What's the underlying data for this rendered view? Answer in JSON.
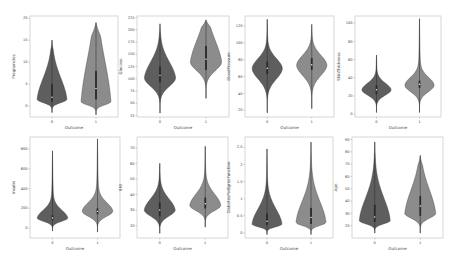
{
  "figure": {
    "colors": {
      "outcome_0": "#5e5e5e",
      "outcome_1": "#8c8c8c",
      "stroke": "#3a3a3a",
      "box": "#2b2b2b",
      "frame": "#bdbdbd"
    }
  },
  "chart_data": [
    {
      "type": "violin",
      "ylabel": "Pregnancies",
      "xlabel": "Outcome",
      "categories": [
        "0",
        "1"
      ],
      "yticks": [
        0,
        5,
        10,
        15,
        20
      ],
      "ylim": [
        -2.5,
        20.5
      ],
      "series": [
        {
          "name": "0",
          "min": -1.5,
          "q1": 1,
          "median": 2,
          "q3": 5,
          "max": 15,
          "peak": 1.5
        },
        {
          "name": "1",
          "min": -2,
          "q1": 1.5,
          "median": 4,
          "q3": 8,
          "max": 19,
          "peak": 1
        }
      ]
    },
    {
      "type": "violin",
      "ylabel": "Glucose",
      "xlabel": "Outcome",
      "categories": [
        "0",
        "1"
      ],
      "yticks": [
        25,
        50,
        75,
        100,
        125,
        150,
        175,
        200,
        225
      ],
      "ylim": [
        22,
        228
      ],
      "series": [
        {
          "name": "0",
          "min": 30,
          "q1": 93,
          "median": 107,
          "q3": 125,
          "max": 212,
          "peak": 102
        },
        {
          "name": "1",
          "min": 60,
          "q1": 118,
          "median": 140,
          "q3": 167,
          "max": 220,
          "peak": 135
        }
      ]
    },
    {
      "type": "violin",
      "ylabel": "BloodPressure",
      "xlabel": "Outcome",
      "categories": [
        "0",
        "1"
      ],
      "yticks": [
        20,
        40,
        60,
        80,
        100,
        120
      ],
      "ylim": [
        12,
        132
      ],
      "series": [
        {
          "name": "0",
          "min": 17,
          "q1": 63,
          "median": 70,
          "q3": 78,
          "max": 128,
          "peak": 70
        },
        {
          "name": "1",
          "min": 22,
          "q1": 68,
          "median": 74,
          "q3": 82,
          "max": 122,
          "peak": 74
        }
      ]
    },
    {
      "type": "violin",
      "ylabel": "SkinThickness",
      "xlabel": "Outcome",
      "categories": [
        "0",
        "1"
      ],
      "yticks": [
        0,
        20,
        40,
        60,
        80,
        100
      ],
      "ylim": [
        -3,
        108
      ],
      "series": [
        {
          "name": "0",
          "min": 2,
          "q1": 22,
          "median": 27,
          "q3": 32,
          "max": 65,
          "peak": 27
        },
        {
          "name": "1",
          "min": 2,
          "q1": 29,
          "median": 33,
          "q3": 37,
          "max": 105,
          "peak": 32
        }
      ]
    },
    {
      "type": "violin",
      "ylabel": "Insulin",
      "xlabel": "Outcome",
      "categories": [
        "0",
        "1"
      ],
      "yticks": [
        0,
        200,
        400,
        600,
        800
      ],
      "ylim": [
        -100,
        920
      ],
      "series": [
        {
          "name": "0",
          "min": -30,
          "q1": 80,
          "median": 102,
          "q3": 130,
          "max": 780,
          "peak": 100
        },
        {
          "name": "1",
          "min": -40,
          "q1": 140,
          "median": 169,
          "q3": 200,
          "max": 900,
          "peak": 170
        }
      ]
    },
    {
      "type": "violin",
      "ylabel": "BMI",
      "xlabel": "Outcome",
      "categories": [
        "0",
        "1"
      ],
      "yticks": [
        20,
        30,
        40,
        50,
        60,
        70
      ],
      "ylim": [
        12,
        77
      ],
      "series": [
        {
          "name": "0",
          "min": 15,
          "q1": 26,
          "median": 30,
          "q3": 35,
          "max": 60,
          "peak": 30
        },
        {
          "name": "1",
          "min": 19,
          "q1": 31,
          "median": 34,
          "q3": 38,
          "max": 71,
          "peak": 33
        }
      ]
    },
    {
      "type": "violin",
      "ylabel": "DiabetesPedigreeFunction",
      "xlabel": "Outcome",
      "categories": [
        "0",
        "1"
      ],
      "yticks": [
        0.0,
        0.5,
        1.0,
        1.5,
        2.0,
        2.5
      ],
      "ylim": [
        -0.15,
        2.8
      ],
      "series": [
        {
          "name": "0",
          "min": -0.05,
          "q1": 0.23,
          "median": 0.34,
          "q3": 0.56,
          "max": 2.45,
          "peak": 0.25
        },
        {
          "name": "1",
          "min": -0.05,
          "q1": 0.26,
          "median": 0.45,
          "q3": 0.73,
          "max": 2.65,
          "peak": 0.3
        }
      ]
    },
    {
      "type": "violin",
      "ylabel": "Age",
      "xlabel": "Outcome",
      "categories": [
        "0",
        "1"
      ],
      "yticks": [
        20,
        30,
        40,
        50,
        60,
        70,
        80,
        90
      ],
      "ylim": [
        10,
        92
      ],
      "series": [
        {
          "name": "0",
          "min": 14,
          "q1": 23,
          "median": 27,
          "q3": 37,
          "max": 88,
          "peak": 24
        },
        {
          "name": "1",
          "min": 14,
          "q1": 28,
          "median": 36,
          "q3": 44,
          "max": 77,
          "peak": 30
        }
      ]
    }
  ]
}
